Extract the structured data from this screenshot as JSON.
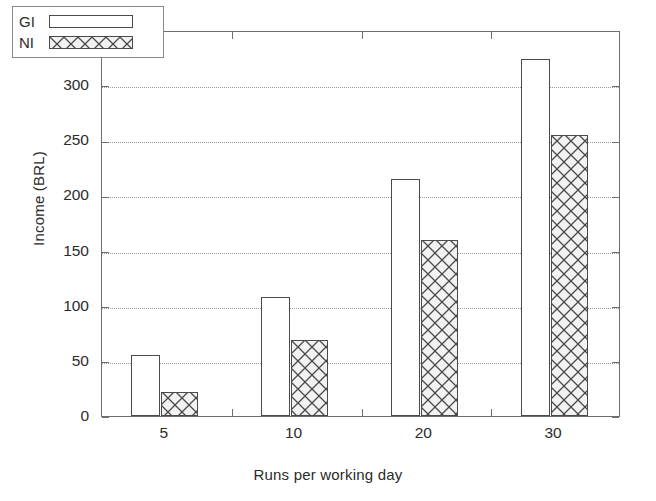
{
  "chart_data": {
    "type": "bar",
    "title": "",
    "subtitle": "",
    "xlabel": "Runs per working day",
    "ylabel": "Income (BRL)",
    "categories": [
      "5",
      "10",
      "20",
      "30"
    ],
    "series": [
      {
        "name": "GI",
        "values": [
          55,
          108,
          215,
          324
        ],
        "fill": "solid-white"
      },
      {
        "name": "NI",
        "values": [
          22,
          69,
          160,
          255
        ],
        "fill": "crosshatch"
      }
    ],
    "ylim": [
      0,
      350
    ],
    "yticks": [
      0,
      50,
      100,
      150,
      200,
      250,
      300,
      350
    ],
    "ytick_labels": [
      "0",
      "50",
      "100",
      "150",
      "200",
      "250",
      "300",
      "350"
    ],
    "grid": "horizontal-dotted",
    "legend_position": "top-left",
    "legend_entries": [
      "GI",
      "NI"
    ],
    "colors": {
      "axis": "#6e6e6e",
      "grid": "#9a9a9a",
      "bar_outline": "#4a4a4a",
      "gi_fill": "#ffffff",
      "ni_fill": "#f2f2f2",
      "text": "#2b2b2b",
      "background": "#ffffff"
    }
  }
}
